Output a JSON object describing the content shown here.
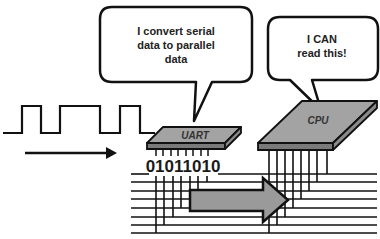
{
  "diagram": {
    "colors": {
      "stroke": "#111111",
      "chip_fill": "#9e9e9e",
      "chip_front": "#7a7a7a",
      "arrow_fill": "#9a9a9a",
      "background": "#ffffff"
    },
    "uart_bubble": {
      "lines": [
        "I convert serial",
        "data to parallel",
        "data"
      ]
    },
    "cpu_bubble": {
      "lines": [
        "I CAN",
        "read this!"
      ]
    },
    "uart_chip": {
      "label": "UART"
    },
    "cpu_chip": {
      "label": "CPU"
    },
    "serial_signal": {
      "label": "serial waveform",
      "direction": "right"
    },
    "parallel_bits": {
      "value": "01011010"
    },
    "bus": {
      "line_count": 8
    }
  }
}
